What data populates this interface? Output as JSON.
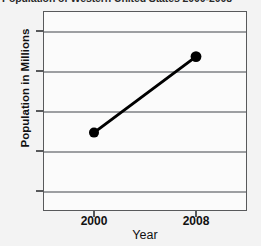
{
  "title_strip": {
    "text": "Population of Western United States 2000-2008",
    "note": "cropped at top edge of screenshot"
  },
  "axis": {
    "y_title": "Population in Millions",
    "x_title": "Year"
  },
  "chart_data": {
    "type": "line",
    "title": "Population of Western United States 2000-2008",
    "xlabel": "Year",
    "ylabel": "Population in Millions",
    "x": [
      2000,
      2008
    ],
    "values": [
      62.3,
      71.8
    ],
    "categories": [
      "2000",
      "2008"
    ],
    "series": [
      {
        "name": "Population in Millions",
        "values": [
          62.3,
          71.8
        ],
        "color": "#000000",
        "marker": "circle",
        "line_width": 3
      }
    ],
    "xlim": [
      1996,
      2012
    ],
    "ylim": [
      52.5,
      77.5
    ],
    "xticks": [
      2000,
      2008
    ],
    "xtick_labels": [
      "2000",
      "2008"
    ],
    "yticks": [
      55,
      60,
      65,
      70,
      75
    ],
    "ytick_labels": [
      "55",
      "60",
      "65",
      "70",
      "75"
    ],
    "grid": true,
    "grid_axis": "y",
    "legend": false,
    "frame_color": "#58595b",
    "grid_color": "#9d9fa2",
    "plot_background": "#fbfbfb",
    "page_background": "#f3f3f3"
  }
}
